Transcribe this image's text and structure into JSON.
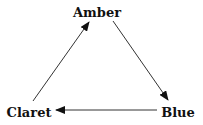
{
  "diagram": {
    "type": "cycle",
    "nodes": [
      {
        "id": "amber",
        "label": "Amber"
      },
      {
        "id": "blue",
        "label": "Blue"
      },
      {
        "id": "claret",
        "label": "Claret"
      }
    ],
    "edges": [
      {
        "from": "Amber",
        "to": "Blue"
      },
      {
        "from": "Blue",
        "to": "Claret"
      },
      {
        "from": "Claret",
        "to": "Amber"
      }
    ]
  }
}
